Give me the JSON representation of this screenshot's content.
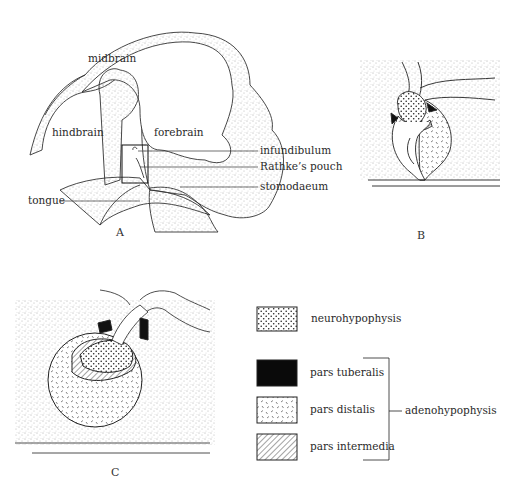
{
  "panelA": {
    "label": "A",
    "regions": {
      "midbrain": "midbrain",
      "hindbrain": "hindbrain",
      "forebrain": "forebrain"
    },
    "callouts": {
      "infundibulum": "infundibulum",
      "rathkes_pouch": "Rathke’s pouch",
      "stomodaeum": "stomodaeum",
      "tongue": "tongue"
    }
  },
  "panelB": {
    "label": "B"
  },
  "panelC": {
    "label": "C"
  },
  "legend": {
    "items": [
      {
        "key": "neurohypophysis",
        "label": "neurohypophysis",
        "pattern": "dots"
      },
      {
        "key": "pars_tuberalis",
        "label": "pars tuberalis",
        "pattern": "solid-black"
      },
      {
        "key": "pars_distalis",
        "label": "pars distalis",
        "pattern": "dashes"
      },
      {
        "key": "pars_intermedia",
        "label": "pars intermedia",
        "pattern": "hatch"
      }
    ],
    "group_label": "adenohypophysis"
  },
  "colors": {
    "ink": "#222222",
    "background": "#ffffff"
  }
}
